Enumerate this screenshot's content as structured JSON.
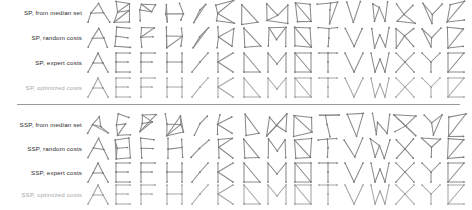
{
  "figure": {
    "title": "",
    "width": 472,
    "height": 210,
    "background": "#ffffff",
    "edge_color": "#8a8a8a",
    "node_color": "#7a7a7a",
    "muted_color": "#a8a8a8",
    "label_color": "#2b2b2b",
    "divider_color": "#9a9a9a"
  },
  "alphabet": [
    "A",
    "E",
    "F",
    "H",
    "I",
    "K",
    "L",
    "M",
    "N",
    "T",
    "V",
    "W",
    "X",
    "Y",
    "Z"
  ],
  "sections": [
    {
      "id": "sp",
      "rows": [
        {
          "label": "SP, from median set",
          "style": "noisy-strong",
          "muted": false
        },
        {
          "label": "SP, random costs",
          "style": "noisy-light",
          "muted": false
        },
        {
          "label": "SP, expert costs",
          "style": "clean",
          "muted": false
        },
        {
          "label": "SP, optimized costs",
          "style": "clean",
          "muted": true
        }
      ]
    },
    {
      "id": "ssp",
      "rows": [
        {
          "label": "SSP, from median set",
          "style": "noisy-strong",
          "muted": false
        },
        {
          "label": "SSP, random costs",
          "style": "noisy-light",
          "muted": false
        },
        {
          "label": "SSP, expert costs",
          "style": "clean",
          "muted": false
        },
        {
          "label": "SSP, optimized costs",
          "style": "clean",
          "muted": true
        }
      ]
    }
  ],
  "chart_data": {
    "type": "table",
    "title": "",
    "xlabel": "",
    "ylabel": "",
    "categories": [
      "A",
      "E",
      "F",
      "H",
      "I",
      "K",
      "L",
      "M",
      "N",
      "T",
      "V",
      "W",
      "X",
      "Y",
      "Z"
    ],
    "row_labels": [
      "SP, from median set",
      "SP, random costs",
      "SP, expert costs",
      "SP, optimized costs",
      "SSP, from median set",
      "SSP, random costs",
      "SSP, expert costs",
      "SSP, optimized costs"
    ],
    "note": "Each cell renders a letter prototype as a node-link graph skeleton; 15 letter classes per row, 8 rows grouped into SP and SSP blocks."
  },
  "letter_graphs": {
    "A": {
      "nodes": [
        [
          2,
          22
        ],
        [
          12,
          3
        ],
        [
          22,
          22
        ],
        [
          7,
          13
        ],
        [
          17,
          13
        ]
      ],
      "edges": [
        [
          0,
          3
        ],
        [
          3,
          1
        ],
        [
          1,
          4
        ],
        [
          4,
          2
        ],
        [
          3,
          4
        ]
      ]
    },
    "E": {
      "nodes": [
        [
          18,
          3
        ],
        [
          4,
          3
        ],
        [
          4,
          12
        ],
        [
          16,
          12
        ],
        [
          4,
          22
        ],
        [
          18,
          22
        ]
      ],
      "edges": [
        [
          0,
          1
        ],
        [
          1,
          2
        ],
        [
          2,
          3
        ],
        [
          2,
          4
        ],
        [
          4,
          5
        ]
      ]
    },
    "F": {
      "nodes": [
        [
          18,
          3
        ],
        [
          4,
          3
        ],
        [
          4,
          12
        ],
        [
          15,
          12
        ],
        [
          4,
          22
        ]
      ],
      "edges": [
        [
          0,
          1
        ],
        [
          1,
          2
        ],
        [
          2,
          3
        ],
        [
          2,
          4
        ]
      ]
    },
    "H": {
      "nodes": [
        [
          4,
          3
        ],
        [
          4,
          12
        ],
        [
          4,
          22
        ],
        [
          19,
          3
        ],
        [
          19,
          12
        ],
        [
          19,
          22
        ]
      ],
      "edges": [
        [
          0,
          1
        ],
        [
          1,
          2
        ],
        [
          1,
          4
        ],
        [
          3,
          4
        ],
        [
          4,
          5
        ]
      ]
    },
    "I": {
      "nodes": [
        [
          20,
          3
        ],
        [
          12,
          12
        ],
        [
          4,
          22
        ]
      ],
      "edges": [
        [
          0,
          1
        ],
        [
          1,
          2
        ]
      ]
    },
    "K": {
      "nodes": [
        [
          4,
          3
        ],
        [
          4,
          12
        ],
        [
          4,
          22
        ],
        [
          19,
          3
        ],
        [
          19,
          22
        ]
      ],
      "edges": [
        [
          0,
          1
        ],
        [
          1,
          2
        ],
        [
          1,
          3
        ],
        [
          1,
          4
        ]
      ]
    },
    "L": {
      "nodes": [
        [
          4,
          3
        ],
        [
          4,
          22
        ],
        [
          20,
          22
        ]
      ],
      "edges": [
        [
          0,
          1
        ],
        [
          1,
          2
        ],
        [
          0,
          2
        ]
      ]
    },
    "M": {
      "nodes": [
        [
          3,
          22
        ],
        [
          3,
          3
        ],
        [
          12,
          14
        ],
        [
          21,
          3
        ],
        [
          21,
          22
        ]
      ],
      "edges": [
        [
          0,
          1
        ],
        [
          1,
          2
        ],
        [
          2,
          3
        ],
        [
          3,
          4
        ]
      ]
    },
    "N": {
      "nodes": [
        [
          4,
          22
        ],
        [
          4,
          3
        ],
        [
          20,
          3
        ],
        [
          20,
          22
        ]
      ],
      "edges": [
        [
          0,
          1
        ],
        [
          1,
          2
        ],
        [
          2,
          3
        ],
        [
          3,
          0
        ],
        [
          1,
          3
        ]
      ]
    },
    "T": {
      "nodes": [
        [
          3,
          3
        ],
        [
          12,
          3
        ],
        [
          21,
          3
        ],
        [
          12,
          12
        ],
        [
          12,
          22
        ]
      ],
      "edges": [
        [
          0,
          1
        ],
        [
          1,
          2
        ],
        [
          1,
          3
        ],
        [
          3,
          4
        ]
      ]
    },
    "V": {
      "nodes": [
        [
          3,
          3
        ],
        [
          12,
          22
        ],
        [
          21,
          3
        ]
      ],
      "edges": [
        [
          0,
          1
        ],
        [
          1,
          2
        ]
      ]
    },
    "W": {
      "nodes": [
        [
          3,
          3
        ],
        [
          7,
          22
        ],
        [
          12,
          9
        ],
        [
          17,
          22
        ],
        [
          21,
          3
        ]
      ],
      "edges": [
        [
          0,
          1
        ],
        [
          1,
          2
        ],
        [
          2,
          3
        ],
        [
          3,
          4
        ]
      ]
    },
    "X": {
      "nodes": [
        [
          3,
          3
        ],
        [
          12,
          12
        ],
        [
          21,
          3
        ],
        [
          3,
          22
        ],
        [
          21,
          22
        ]
      ],
      "edges": [
        [
          0,
          1
        ],
        [
          1,
          2
        ],
        [
          1,
          3
        ],
        [
          1,
          4
        ]
      ]
    },
    "Y": {
      "nodes": [
        [
          3,
          3
        ],
        [
          12,
          12
        ],
        [
          21,
          3
        ],
        [
          12,
          22
        ]
      ],
      "edges": [
        [
          0,
          1
        ],
        [
          1,
          2
        ],
        [
          1,
          3
        ]
      ]
    },
    "Z": {
      "nodes": [
        [
          4,
          3
        ],
        [
          20,
          3
        ],
        [
          4,
          22
        ],
        [
          20,
          22
        ]
      ],
      "edges": [
        [
          0,
          1
        ],
        [
          1,
          2
        ],
        [
          2,
          3
        ],
        [
          0,
          2
        ]
      ]
    }
  }
}
